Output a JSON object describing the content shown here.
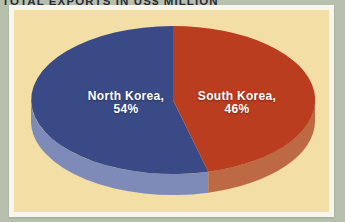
{
  "chart_data": {
    "type": "pie",
    "style": "3d",
    "title": "TOTAL EXPORTS IN US$ MILLION",
    "labels": [
      "North Korea",
      "South Korea"
    ],
    "values": [
      54,
      46
    ],
    "unit": "percent",
    "legend_position": "none",
    "direction": "counterclockwise",
    "start_angle_deg": 0,
    "slices": [
      {
        "name": "North Korea",
        "value": 54,
        "label_line1": "North Korea,",
        "label_line2": "54%",
        "color": "#3a4a86",
        "side_color": "#7e8ab8",
        "label_pos": {
          "x": 126,
          "y": 103
        }
      },
      {
        "name": "South Korea",
        "value": 46,
        "label_line1": "South Korea,",
        "label_line2": "46%",
        "color": "#b93d1e",
        "side_color": "#bd6a44",
        "label_pos": {
          "x": 237,
          "y": 103
        }
      }
    ],
    "geometry": {
      "cx": 173,
      "cy": 100,
      "rx": 142,
      "ry": 74,
      "depth": 21
    }
  },
  "colors": {
    "page_bg": "#b7c0ad",
    "frame": "#f8f5ed",
    "panel": "#f3dfa5",
    "caption_text": "#2a2a38",
    "label_text": "#ffffff"
  }
}
